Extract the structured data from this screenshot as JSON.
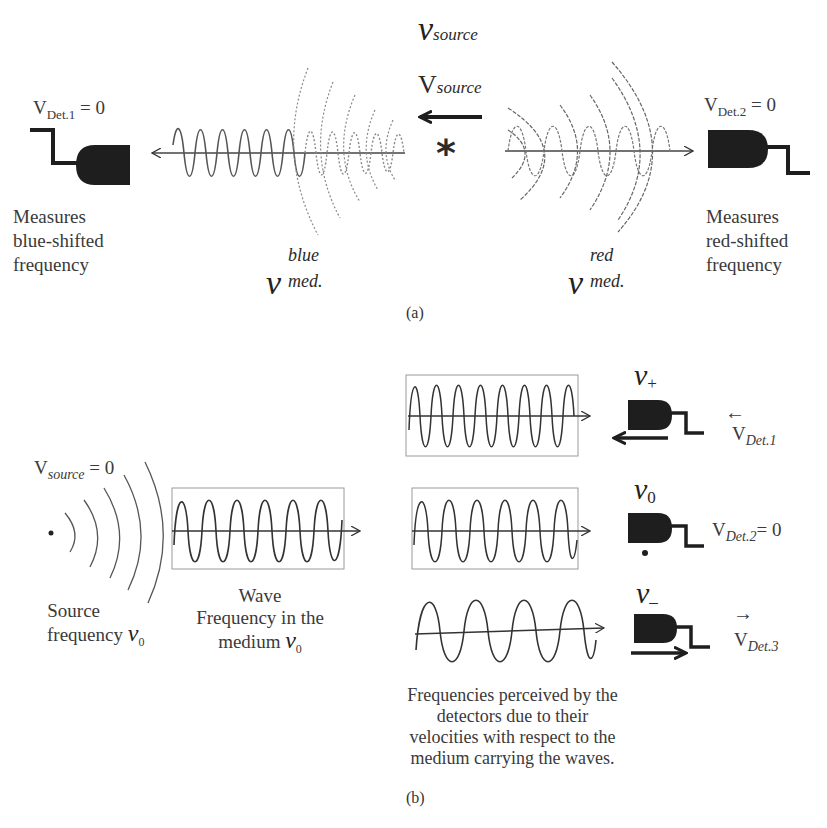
{
  "panel_a": {
    "caption": "(a)",
    "source_symbol": "ν",
    "source_sub": "source",
    "source_velocity_symbol": "V",
    "source_velocity_sub": "source",
    "source_marker": "*",
    "detector_left": {
      "velocity_label": "V",
      "velocity_sub": "Det.1",
      "velocity_value": "= 0",
      "description": [
        "Measures",
        "blue-shifted",
        "frequency"
      ]
    },
    "detector_right": {
      "velocity_label": "V",
      "velocity_sub": "Det.2",
      "velocity_value": "= 0",
      "description": [
        "Measures",
        "red-shifted",
        "frequency"
      ]
    },
    "freq_blue": {
      "symbol": "ν",
      "sup": "blue",
      "sub": "med."
    },
    "freq_red": {
      "symbol": "ν",
      "sup": "red",
      "sub": "med."
    }
  },
  "panel_b": {
    "caption": "(b)",
    "source_velocity": {
      "label": "V",
      "sub": "source",
      "value": "= 0"
    },
    "source_caption": {
      "line1": "Source",
      "line2": "frequency",
      "symbol": "ν",
      "sub": "0"
    },
    "wave_caption": {
      "line1": "Wave",
      "line2": "Frequency in the",
      "line3": "medium",
      "symbol": "ν",
      "sub": "0"
    },
    "detectors": [
      {
        "freq_symbol": "ν",
        "freq_sub": "+",
        "velocity_label": "V",
        "velocity_sub": "Det.1",
        "velocity_value": "",
        "arrow": "←"
      },
      {
        "freq_symbol": "ν",
        "freq_sub": "0",
        "velocity_label": "V",
        "velocity_sub": "Det.2",
        "velocity_value": "= 0",
        "arrow": ""
      },
      {
        "freq_symbol": "ν",
        "freq_sub": "–",
        "velocity_label": "V",
        "velocity_sub": "Det.3",
        "velocity_value": "",
        "arrow": "→"
      }
    ],
    "perceived_caption": [
      "Frequencies perceived by the",
      "detectors due to their",
      "velocities with respect to the",
      "medium carrying the waves."
    ]
  },
  "colors": {
    "ink": "#1e1e1e",
    "wave": "#555555",
    "dotted": "#8a8a8a",
    "box": "#9a9a9a"
  }
}
